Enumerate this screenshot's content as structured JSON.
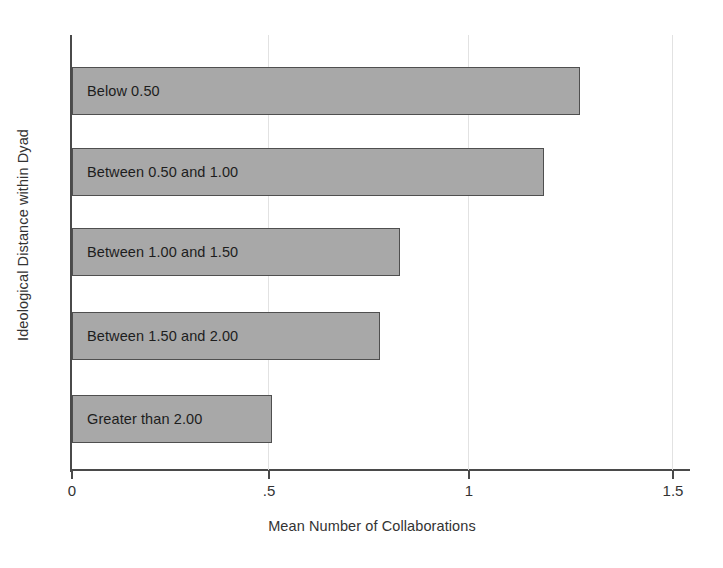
{
  "chart_data": {
    "type": "bar",
    "orientation": "horizontal",
    "title": "",
    "xlabel": "Mean Number of Collaborations",
    "ylabel": "Ideological Distance within Dyad",
    "categories": [
      "Below 0.50",
      "Between 0.50 and 1.00",
      "Between 1.00 and 1.50",
      "Between 1.50 and 2.00",
      "Greater than 2.00"
    ],
    "values": [
      1.27,
      1.18,
      0.82,
      0.77,
      0.5
    ],
    "xlim": [
      0,
      1.5
    ],
    "xticks": [
      0,
      0.5,
      1,
      1.5
    ],
    "xtick_labels": [
      "0",
      ".5",
      "1",
      "1.5"
    ],
    "ytick_labels": [],
    "grid": "vertical-faint",
    "legend": "none",
    "bar_fill_color": "#a8a8a8",
    "bar_border_color": "#4f4f4f",
    "axis_color": "#4a4a4a",
    "labels_inside_bars": true
  }
}
